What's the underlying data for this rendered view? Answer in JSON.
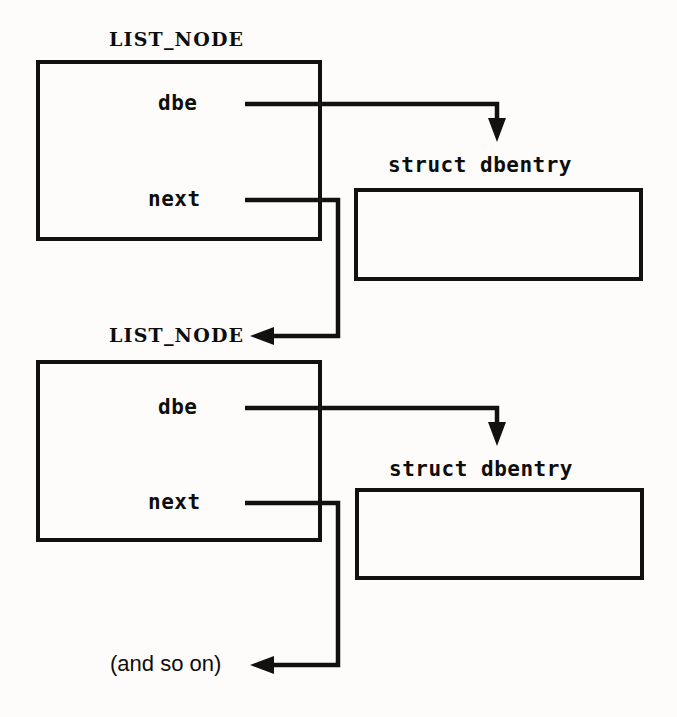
{
  "diagram": {
    "colors": {
      "stroke": "#111111",
      "background": "#fdfcfa",
      "text": "#0d0d0d"
    },
    "nodes": [
      {
        "id": "list-node-1",
        "title": "LIST_NODE",
        "fields": [
          {
            "name": "dbe",
            "label": "dbe"
          },
          {
            "name": "next",
            "label": "next"
          }
        ]
      },
      {
        "id": "list-node-2",
        "title": "LIST_NODE",
        "fields": [
          {
            "name": "dbe",
            "label": "dbe"
          },
          {
            "name": "next",
            "label": "next"
          }
        ]
      }
    ],
    "records": [
      {
        "id": "dbentry-1",
        "title": "struct dbentry"
      },
      {
        "id": "dbentry-2",
        "title": "struct dbentry"
      }
    ],
    "continuation": {
      "label": "(and so on)"
    },
    "edges": [
      {
        "from": "list-node-1.dbe",
        "to": "dbentry-1"
      },
      {
        "from": "list-node-1.next",
        "to": "list-node-2"
      },
      {
        "from": "list-node-2.dbe",
        "to": "dbentry-2"
      },
      {
        "from": "list-node-2.next",
        "to": "continuation"
      }
    ]
  }
}
